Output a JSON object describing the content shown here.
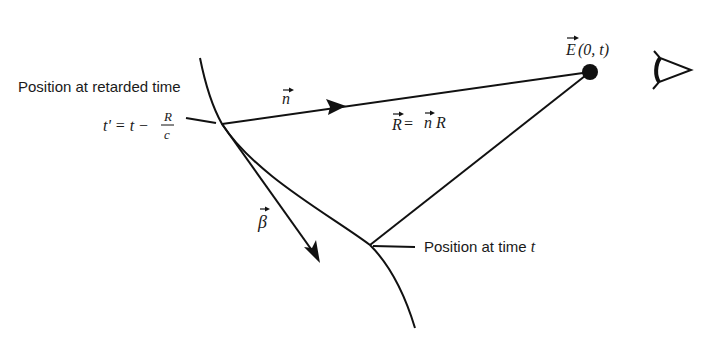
{
  "diagram": {
    "type": "physics-schematic",
    "labels": {
      "retarded_position": "Position at retarded time",
      "retarded_time_eq_lhs": "t' = t − ",
      "retarded_time_frac_num": "R",
      "retarded_time_frac_den": "c",
      "unit_vector": "n",
      "separation_eq": "R = n R",
      "separation_R": "R",
      "separation_eq_sign": " = ",
      "separation_n": "n",
      "separation_R2": "R",
      "field_E": "E",
      "field_args": "(0, t)",
      "velocity_vector": "β",
      "present_position": "Position at time ",
      "present_t": "t"
    },
    "elements": [
      {
        "id": "trajectory",
        "kind": "curve",
        "description": "particle path"
      },
      {
        "id": "n-vector",
        "kind": "arrow",
        "from": "retarded-point",
        "to": "observer-point"
      },
      {
        "id": "beta-vector",
        "kind": "arrow",
        "from": "retarded-point",
        "description": "velocity tangent"
      },
      {
        "id": "present-to-observer",
        "kind": "line"
      },
      {
        "id": "observer-point",
        "kind": "dot"
      },
      {
        "id": "eye",
        "kind": "icon"
      }
    ],
    "colors": {
      "ink": "#111111",
      "background": "#ffffff"
    }
  }
}
